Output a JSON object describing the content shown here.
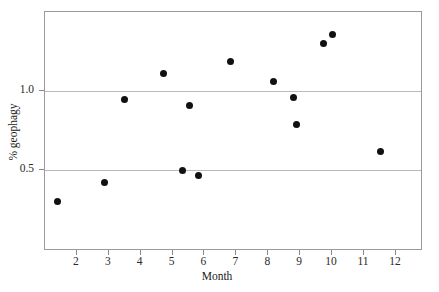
{
  "chart_data": {
    "type": "scatter",
    "title": "",
    "xlabel": "Month",
    "ylabel": "% geophagy",
    "xlim": [
      1.0,
      12.85
    ],
    "ylim": [
      -0.01,
      1.5
    ],
    "grid": true,
    "legend": "none",
    "xticks": [
      2,
      3,
      4,
      5,
      6,
      7,
      8,
      9,
      10,
      11,
      12
    ],
    "xtick_labels": [
      "2",
      "3",
      "4",
      "5",
      "6",
      "7",
      "8",
      "9",
      "10",
      "11",
      "12"
    ],
    "yticks": [
      0.5,
      1.0
    ],
    "ytick_labels": [
      "0.5",
      "1.0"
    ],
    "gridlines_y": [
      0.5,
      1.0
    ],
    "marker": "filled-circle",
    "marker_color": "#111111",
    "points": [
      {
        "x": 1.4,
        "y": 0.3
      },
      {
        "x": 2.88,
        "y": 0.42
      },
      {
        "x": 3.5,
        "y": 0.95
      },
      {
        "x": 4.72,
        "y": 1.11
      },
      {
        "x": 5.3,
        "y": 0.5
      },
      {
        "x": 5.53,
        "y": 0.91
      },
      {
        "x": 5.82,
        "y": 0.47
      },
      {
        "x": 6.82,
        "y": 1.19
      },
      {
        "x": 8.17,
        "y": 1.06
      },
      {
        "x": 8.8,
        "y": 0.96
      },
      {
        "x": 8.89,
        "y": 0.79
      },
      {
        "x": 9.72,
        "y": 1.3
      },
      {
        "x": 10.0,
        "y": 1.36
      },
      {
        "x": 11.52,
        "y": 0.62
      }
    ]
  },
  "axes": {
    "x_title": "Month",
    "y_title": "% geophagy"
  }
}
